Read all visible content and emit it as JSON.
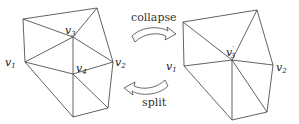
{
  "diagram": {
    "left_mesh": {
      "labels": {
        "v1": "v1",
        "v2": "v2",
        "v3": "v3",
        "v4": "v4"
      }
    },
    "right_mesh": {
      "labels": {
        "v1": "v1",
        "v2": "v2",
        "v3p": "v3'"
      }
    },
    "arrows": {
      "collapse": "collapse",
      "split": "split"
    },
    "colors": {
      "stroke": "#3a3a3a",
      "background": "#ffffff"
    }
  }
}
